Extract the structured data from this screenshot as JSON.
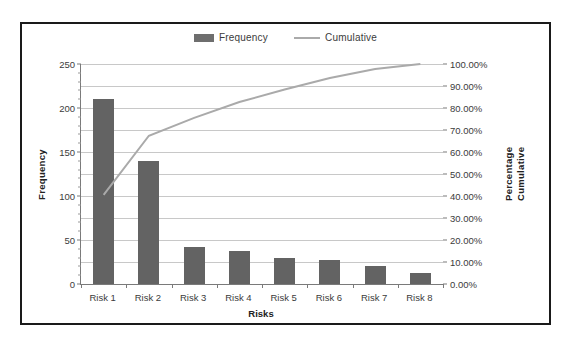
{
  "legend": {
    "items": [
      {
        "label": "Frequency",
        "marker": "bar-swatch-icon",
        "color": "#636363"
      },
      {
        "label": "Cumulative",
        "marker": "line-swatch-icon",
        "color": "#aaaaaa"
      }
    ]
  },
  "axes": {
    "y_left_title": "Frequency",
    "y_right_title_line1": "Cumulative",
    "y_right_title_line2": "Percentage",
    "x_title": "Risks",
    "y_left_ticks": [
      "0",
      "50",
      "100",
      "150",
      "200",
      "250"
    ],
    "y_right_ticks": [
      "0.00%",
      "10.00%",
      "20.00%",
      "30.00%",
      "40.00%",
      "50.00%",
      "60.00%",
      "70.00%",
      "80.00%",
      "90.00%",
      "100.00%"
    ]
  },
  "chart_data": {
    "type": "bar",
    "title": "",
    "subtitle": "",
    "xlabel": "Risks",
    "ylabel": "Frequency",
    "y2label": "Cumulative Percentage",
    "categories": [
      "Risk 1",
      "Risk 2",
      "Risk 3",
      "Risk 4",
      "Risk 5",
      "Risk 6",
      "Risk 7",
      "Risk 8"
    ],
    "ylim": [
      0,
      250
    ],
    "y2lim": [
      0,
      100
    ],
    "grid": true,
    "legend_position": "top-center",
    "series": [
      {
        "name": "Frequency",
        "type": "bar",
        "axis": "left",
        "color": "#636363",
        "values": [
          210,
          140,
          42,
          37,
          30,
          27,
          21,
          12
        ]
      },
      {
        "name": "Cumulative",
        "type": "line",
        "axis": "right",
        "color": "#aaaaaa",
        "values": [
          40.5,
          67.4,
          75.5,
          82.7,
          88.4,
          93.6,
          97.7,
          100.0
        ]
      }
    ]
  }
}
